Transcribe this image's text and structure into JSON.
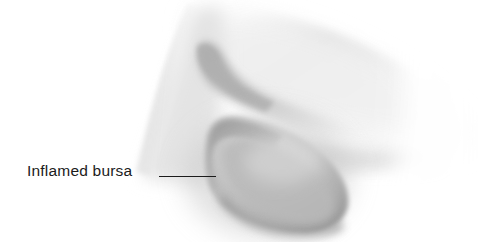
{
  "figure": {
    "name": "inflamed-bursa-knee-illustration",
    "background_color": "#ffffff"
  },
  "annotations": [
    {
      "id": "inflamed-bursa",
      "label": "Inflamed bursa",
      "text_color": "#1b1b1b",
      "text_x": 27,
      "text_y": 163,
      "font_size": "15.5px",
      "leader_line": {
        "x1": 159,
        "y1": 176,
        "x2": 216,
        "y2": 176,
        "color": "#1b1b1b",
        "width": 1.4
      }
    }
  ],
  "label": {
    "inflamed_bursa": "Inflamed bursa"
  },
  "illustration": {
    "style": "grayscale airbrushed medical illustration",
    "palette": {
      "highlight": "#ffffff",
      "light_tone": "#eeeeee",
      "mid_tone": "#d8d8d8",
      "shadow_tone": "#b4b4b4",
      "deep_shadow": "#8d8d8d",
      "outline": "#1b1b1b"
    },
    "regions": [
      {
        "name": "thigh-upper-leg",
        "description": "broad soft-edged mass sweeping from upper left to the right, fading to white at the right margin"
      },
      {
        "name": "knee-crease-notch",
        "description": "concave notch along the anterior contour where the thigh meets the patella"
      },
      {
        "name": "inflamed-bursa-swelling",
        "description": "rounded darker grey bulge at the front of the knee indicating the swollen prepatellar bursa"
      },
      {
        "name": "lower-leg-shin",
        "description": "tapering form extending down and to the right below the bursa"
      }
    ]
  }
}
